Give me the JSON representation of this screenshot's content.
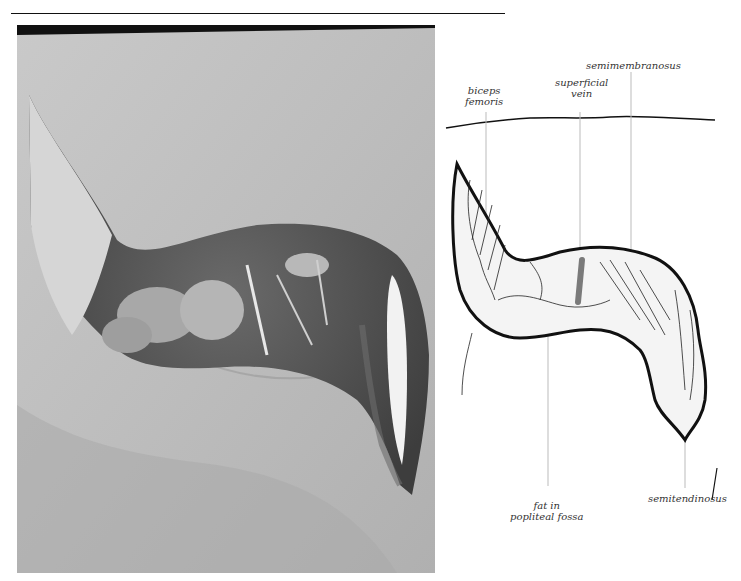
{
  "figure": {
    "photo": {
      "alt": "Dissection photograph of the posterior knee region showing opened popliteal fossa"
    },
    "labels": {
      "biceps_femoris": "biceps\nfemoris",
      "superficial_vein": "superficial\nvein",
      "semimembranosus": "semimembranosus",
      "fat_in_popliteal_fossa": "fat in\npopliteal fossa",
      "semitendinosus": "semitendinosus"
    },
    "colors": {
      "vein": "#7a7a7a",
      "outline": "#111111",
      "leader": "#bbbbbb"
    }
  }
}
